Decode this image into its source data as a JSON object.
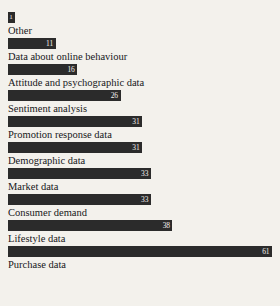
{
  "chart_data": {
    "type": "bar",
    "orientation": "horizontal",
    "title": "",
    "subtitle": "",
    "xlabel": "",
    "ylabel": "",
    "grid": false,
    "legend": null,
    "value_labels_inside_bars": true,
    "label_position": "below-bar",
    "xlim": [
      0,
      61
    ],
    "categories": [
      "Other",
      "Data about online behaviour",
      "Attitude and psychographic data",
      "Sentiment analysis",
      "Promotion response data",
      "Demographic data",
      "Market data",
      "Consumer demand",
      "Lifestyle data",
      "Purchase data"
    ],
    "values": [
      1,
      11,
      16,
      26,
      31,
      31,
      33,
      33,
      38,
      61
    ],
    "bars": [
      {
        "label": "Other",
        "value": 1,
        "value_text": "1"
      },
      {
        "label": "Data about online behaviour",
        "value": 11,
        "value_text": "11"
      },
      {
        "label": "Attitude and psychographic data",
        "value": 16,
        "value_text": "16"
      },
      {
        "label": "Sentiment analysis",
        "value": 26,
        "value_text": "26"
      },
      {
        "label": "Promotion response data",
        "value": 31,
        "value_text": "31"
      },
      {
        "label": "Demographic data",
        "value": 31,
        "value_text": "31"
      },
      {
        "label": "Market data",
        "value": 33,
        "value_text": "33"
      },
      {
        "label": "Consumer demand",
        "value": 33,
        "value_text": "33"
      },
      {
        "label": "Lifestyle data",
        "value": 38,
        "value_text": "38"
      },
      {
        "label": "Purchase data",
        "value": 61,
        "value_text": "61"
      }
    ],
    "colors": {
      "background": "#f3f1ec",
      "bar": "#2b2b2b",
      "value_text": "#f3f1ec",
      "category_text": "#17171a"
    }
  }
}
